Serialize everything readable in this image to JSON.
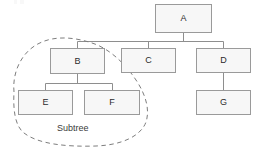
{
  "diagram": {
    "type": "tree",
    "title": "",
    "background_color": "#ffffff",
    "node_fill": "#f7f7f7",
    "node_border": "#9a9a9a",
    "edge_color": "#8e8e8e",
    "dashed_color": "#7d7d7d",
    "label_color": "#2b2b2b",
    "nodes": [
      {
        "id": "A",
        "label": "A",
        "x": 155,
        "y": 4,
        "w": 57,
        "h": 29
      },
      {
        "id": "B",
        "label": "B",
        "x": 50,
        "y": 48,
        "w": 55,
        "h": 26
      },
      {
        "id": "C",
        "label": "C",
        "x": 121,
        "y": 48,
        "w": 55,
        "h": 25
      },
      {
        "id": "D",
        "label": "D",
        "x": 196,
        "y": 48,
        "w": 55,
        "h": 25
      },
      {
        "id": "E",
        "label": "E",
        "x": 18,
        "y": 90,
        "w": 55,
        "h": 25
      },
      {
        "id": "F",
        "label": "F",
        "x": 84,
        "y": 90,
        "w": 56,
        "h": 25
      },
      {
        "id": "G",
        "label": "G",
        "x": 196,
        "y": 90,
        "w": 55,
        "h": 25
      }
    ],
    "edges": [
      {
        "from": "A",
        "to": "B"
      },
      {
        "from": "A",
        "to": "C"
      },
      {
        "from": "A",
        "to": "D"
      },
      {
        "from": "B",
        "to": "E"
      },
      {
        "from": "B",
        "to": "F"
      },
      {
        "from": "D",
        "to": "G"
      }
    ],
    "annotation": {
      "label": "Subtree",
      "label_x": 57,
      "label_y": 124,
      "encloses": [
        "B",
        "E",
        "F"
      ],
      "style": "dashed-outline"
    }
  }
}
